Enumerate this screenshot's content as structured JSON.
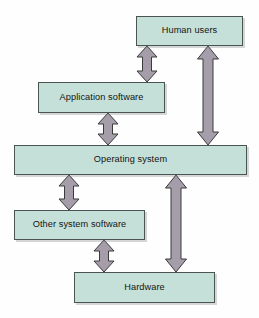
{
  "diagram": {
    "type": "block-diagram",
    "canvas": {
      "width": 259,
      "height": 318
    },
    "colors": {
      "background": "#fefefe",
      "box_fill": "#c5e0d8",
      "box_border": "#4a5450",
      "box_shadow": "rgba(120,125,125,0.30)",
      "arrow_fill": "#a69daa",
      "arrow_border": "#3a3a3a",
      "text": "#141414"
    },
    "nodes": [
      {
        "id": "human-users",
        "label": "Human users",
        "x": 136,
        "y": 16,
        "width": 107,
        "height": 30
      },
      {
        "id": "application-software",
        "label": "Application software",
        "x": 38,
        "y": 82,
        "width": 127,
        "height": 31
      },
      {
        "id": "operating-system",
        "label": "Operating system",
        "x": 14,
        "y": 145,
        "width": 233,
        "height": 30
      },
      {
        "id": "other-system-software",
        "label": "Other system software",
        "x": 14,
        "y": 210,
        "width": 131,
        "height": 30
      },
      {
        "id": "hardware",
        "label": "Hardware",
        "x": 74,
        "y": 272,
        "width": 141,
        "height": 31
      }
    ],
    "connectors": [
      {
        "id": "human-users-to-application-software",
        "from": "human-users",
        "to": "application-software",
        "direction": "bidirectional",
        "cx": 147,
        "top": 46,
        "bottom": 82,
        "shaft_half_width": 4.5,
        "head_half_width": 10,
        "head_height": 11
      },
      {
        "id": "human-users-to-operating-system",
        "from": "human-users",
        "to": "operating-system",
        "direction": "bidirectional",
        "cx": 208,
        "top": 46,
        "bottom": 145,
        "shaft_half_width": 5,
        "head_half_width": 10.5,
        "head_height": 13
      },
      {
        "id": "application-software-to-operating-system",
        "from": "application-software",
        "to": "operating-system",
        "direction": "bidirectional",
        "cx": 108,
        "top": 113,
        "bottom": 145,
        "shaft_half_width": 4.5,
        "head_half_width": 10,
        "head_height": 11
      },
      {
        "id": "operating-system-to-other-system-software",
        "from": "operating-system",
        "to": "other-system-software",
        "direction": "bidirectional",
        "cx": 69,
        "top": 175,
        "bottom": 210,
        "shaft_half_width": 4.5,
        "head_half_width": 10,
        "head_height": 11
      },
      {
        "id": "operating-system-to-hardware",
        "from": "operating-system",
        "to": "hardware",
        "direction": "bidirectional",
        "cx": 176,
        "top": 175,
        "bottom": 272,
        "shaft_half_width": 5,
        "head_half_width": 10.5,
        "head_height": 13
      },
      {
        "id": "other-system-software-to-hardware",
        "from": "other-system-software",
        "to": "hardware",
        "direction": "bidirectional",
        "cx": 104,
        "top": 240,
        "bottom": 272,
        "shaft_half_width": 4.5,
        "head_half_width": 10,
        "head_height": 11
      }
    ]
  }
}
